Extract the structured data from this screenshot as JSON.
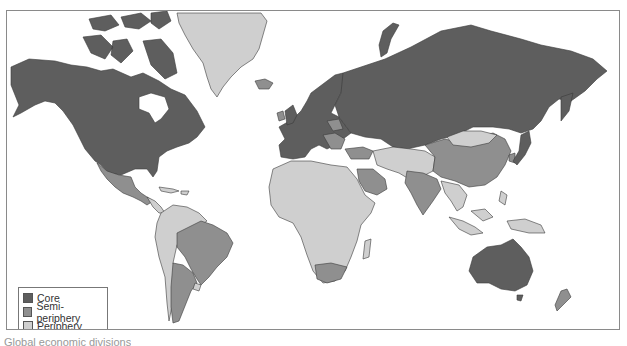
{
  "map": {
    "title": "World-systems map",
    "colors": {
      "core": "#5e5e5e",
      "semi_periphery": "#8f8f8f",
      "periphery": "#cfcfcf",
      "ocean": "#ffffff",
      "border": "#3a3a3a"
    },
    "regions": [
      {
        "name": "North America (USA, Canada)",
        "category": "Core"
      },
      {
        "name": "Greenland",
        "category": "Periphery"
      },
      {
        "name": "Iceland",
        "category": "Semi-periphery"
      },
      {
        "name": "Western Europe",
        "category": "Core"
      },
      {
        "name": "Eastern Europe",
        "category": "Core"
      },
      {
        "name": "Russia",
        "category": "Core"
      },
      {
        "name": "Japan",
        "category": "Core"
      },
      {
        "name": "Australia",
        "category": "Core"
      },
      {
        "name": "New Zealand",
        "category": "Semi-periphery"
      },
      {
        "name": "Mexico",
        "category": "Semi-periphery"
      },
      {
        "name": "Brazil",
        "category": "Semi-periphery"
      },
      {
        "name": "Argentina",
        "category": "Semi-periphery"
      },
      {
        "name": "China",
        "category": "Semi-periphery"
      },
      {
        "name": "India",
        "category": "Semi-periphery"
      },
      {
        "name": "Saudi Arabia",
        "category": "Semi-periphery"
      },
      {
        "name": "South Africa",
        "category": "Semi-periphery"
      },
      {
        "name": "Turkey",
        "category": "Semi-periphery"
      },
      {
        "name": "Mongolia",
        "category": "Periphery"
      },
      {
        "name": "Africa (most)",
        "category": "Periphery"
      },
      {
        "name": "Central Asia / Middle East (most)",
        "category": "Periphery"
      },
      {
        "name": "Southeast Asia",
        "category": "Periphery"
      },
      {
        "name": "South America (rest)",
        "category": "Periphery"
      }
    ]
  },
  "legend": {
    "items": [
      {
        "label": "Core",
        "color": "#5e5e5e"
      },
      {
        "label": "Semi-periphery",
        "color": "#8f8f8f"
      },
      {
        "label": "Periphery",
        "color": "#cfcfcf"
      }
    ]
  },
  "caption": "Global economic divisions"
}
